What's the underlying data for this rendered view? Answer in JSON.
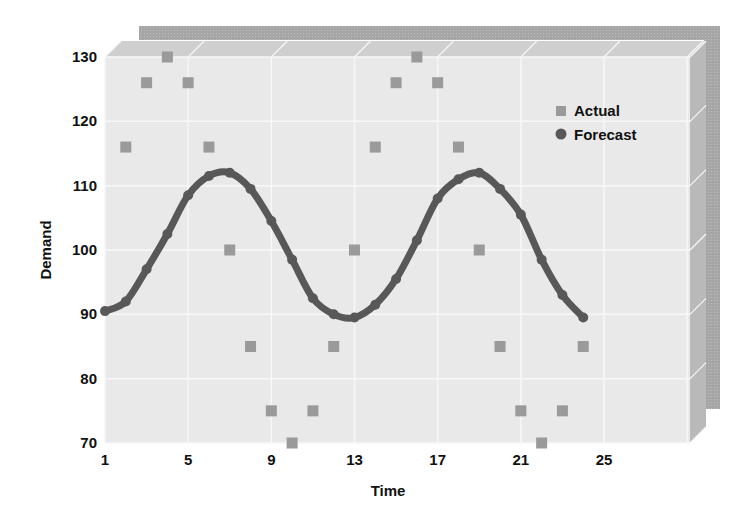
{
  "chart_data": {
    "type": "scatter",
    "title": "",
    "xlabel": "Time",
    "ylabel": "Demand",
    "xlim": [
      1,
      25
    ],
    "ylim": [
      70,
      130
    ],
    "x_ticks": [
      1,
      5,
      9,
      13,
      17,
      21,
      25
    ],
    "y_ticks": [
      70,
      80,
      90,
      100,
      110,
      120,
      130
    ],
    "grid": true,
    "legend_position": "upper right inside",
    "series": [
      {
        "name": "Actual",
        "marker": "square",
        "color": "#9a9a9a",
        "x": [
          2,
          3,
          4,
          5,
          6,
          7,
          8,
          9,
          10,
          11,
          12,
          13,
          14,
          15,
          16,
          17,
          18,
          19,
          20,
          21,
          22,
          23,
          24
        ],
        "values": [
          116,
          126,
          130,
          126,
          116,
          100,
          85,
          75,
          70,
          75,
          85,
          100,
          116,
          126,
          130,
          126,
          116,
          100,
          85,
          75,
          70,
          75,
          85
        ]
      },
      {
        "name": "Forecast",
        "marker": "circle-line",
        "color": "#585858",
        "x": [
          1,
          2,
          3,
          4,
          5,
          6,
          7,
          8,
          9,
          10,
          11,
          12,
          13,
          14,
          15,
          16,
          17,
          18,
          19,
          20,
          21,
          22,
          23,
          24
        ],
        "values": [
          90.5,
          92,
          97,
          102.5,
          108.5,
          111.5,
          112,
          109.5,
          104.5,
          98.5,
          92.5,
          90,
          89.5,
          91.5,
          95.5,
          101.5,
          108,
          111,
          112,
          109.5,
          105.5,
          98.5,
          93,
          89.5
        ]
      }
    ]
  },
  "colors": {
    "panel_face": "#e9e9e9",
    "panel_top": "#cfcfcf",
    "panel_side": "#b8b8b8",
    "back_panel": "#a9a9a9",
    "grid": "#f7f7f7",
    "actual": "#9a9a9a",
    "forecast": "#585858"
  }
}
